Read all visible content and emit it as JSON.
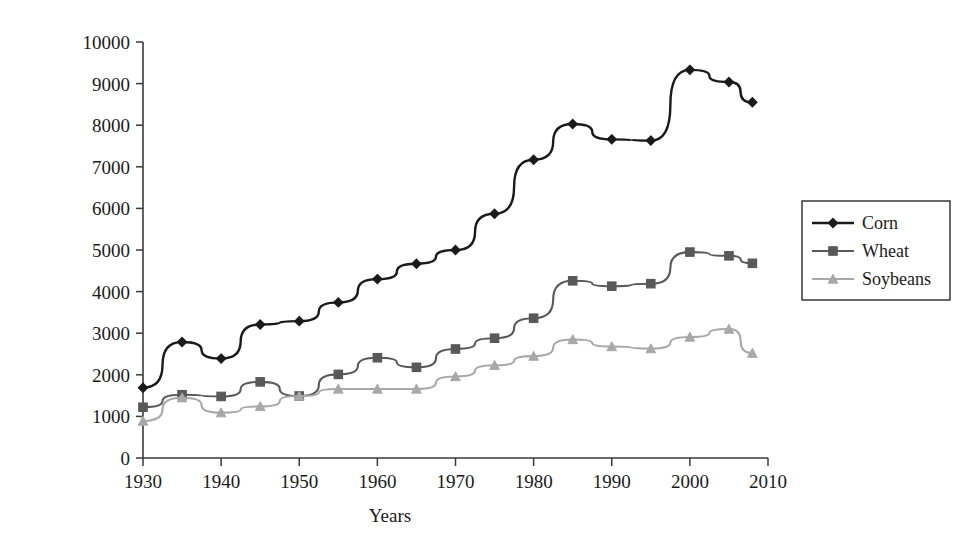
{
  "chart_data": {
    "type": "line",
    "title": "",
    "xlabel": "Years",
    "ylabel": "Yield (kg/ha)",
    "xlim": [
      1930,
      2010
    ],
    "ylim": [
      0,
      10000
    ],
    "xticks": [
      1930,
      1940,
      1950,
      1960,
      1970,
      1980,
      1990,
      2000,
      2010
    ],
    "yticks": [
      0,
      1000,
      2000,
      3000,
      4000,
      5000,
      6000,
      7000,
      8000,
      9000,
      10000
    ],
    "grid": false,
    "legend_position": "right",
    "x": [
      1930,
      1935,
      1940,
      1945,
      1950,
      1955,
      1960,
      1965,
      1970,
      1975,
      1980,
      1985,
      1990,
      1995,
      2000,
      2005,
      2008
    ],
    "series": [
      {
        "name": "Corn",
        "color": "#1a1a1a",
        "marker": "diamond",
        "values": [
          1690,
          2790,
          2390,
          3210,
          3290,
          3740,
          4300,
          4670,
          5000,
          5870,
          7170,
          8030,
          7660,
          7630,
          9330,
          9040,
          8550
        ]
      },
      {
        "name": "Wheat",
        "color": "#595959",
        "marker": "square",
        "values": [
          1220,
          1520,
          1480,
          1830,
          1490,
          2010,
          2410,
          2180,
          2620,
          2880,
          3360,
          4260,
          4130,
          4190,
          4950,
          4860,
          4680
        ]
      },
      {
        "name": "Soybeans",
        "color": "#a8a8a8",
        "marker": "triangle",
        "values": [
          890,
          1450,
          1090,
          1240,
          1490,
          1660,
          1660,
          1660,
          1960,
          2230,
          2450,
          2850,
          2680,
          2630,
          2910,
          3100,
          2520
        ]
      }
    ]
  },
  "legend": {
    "entries": [
      {
        "label": "Corn"
      },
      {
        "label": "Wheat"
      },
      {
        "label": "Soybeans"
      }
    ]
  },
  "axes": {
    "x_title": "Years",
    "y_title": "Yield (kg/ha)"
  }
}
